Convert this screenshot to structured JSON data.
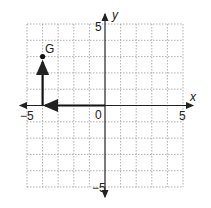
{
  "graph": {
    "x_axis_label": "x",
    "y_axis_label": "y",
    "x_min_label": "−5",
    "x_max_label": "5",
    "y_max_label": "5",
    "y_min_label": "−5",
    "origin_label": "0",
    "point_label": "G",
    "point": {
      "x": -4,
      "y": 3
    },
    "path": [
      {
        "from": [
          0,
          0
        ],
        "to": [
          -4,
          0
        ]
      },
      {
        "from": [
          -4,
          0
        ],
        "to": [
          -4,
          3
        ]
      }
    ],
    "grid_range": [
      -5,
      5
    ],
    "colors": {
      "grid": "#9a9a9a",
      "axis": "#222222",
      "path": "#111111"
    }
  }
}
